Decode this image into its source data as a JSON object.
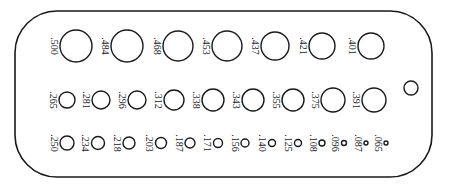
{
  "diagram": {
    "type": "drill-size-gauge",
    "unit": "inch",
    "colors": {
      "outline": "#1a1a1a",
      "background": "#ffffff"
    },
    "plate": {
      "x": 15,
      "y": 11,
      "width": 417,
      "height": 166,
      "corner_radius": 42
    },
    "hanging_hole": {
      "cx": 411,
      "cy": 88,
      "r": 7
    },
    "rows": [
      {
        "name": "row-1",
        "cy": 46,
        "holes": [
          {
            "label": ".500",
            "cx": 76,
            "r": 16
          },
          {
            "label": ".484",
            "cx": 127,
            "r": 16
          },
          {
            "label": ".468",
            "cx": 178,
            "r": 15
          },
          {
            "label": ".453",
            "cx": 227,
            "r": 15
          },
          {
            "label": ".437",
            "cx": 275,
            "r": 14
          },
          {
            "label": ".421",
            "cx": 322,
            "r": 13
          },
          {
            "label": ".401",
            "cx": 371,
            "r": 13
          }
        ]
      },
      {
        "name": "row-2",
        "cy": 100,
        "holes": [
          {
            "label": ".265",
            "cx": 67,
            "r": 8
          },
          {
            "label": ".281",
            "cx": 101,
            "r": 9
          },
          {
            "label": ".296",
            "cx": 137,
            "r": 9
          },
          {
            "label": ".312",
            "cx": 174,
            "r": 10
          },
          {
            "label": ".338",
            "cx": 213,
            "r": 11
          },
          {
            "label": ".343",
            "cx": 253,
            "r": 11
          },
          {
            "label": ".355",
            "cx": 293,
            "r": 11
          },
          {
            "label": ".375",
            "cx": 333,
            "r": 12
          },
          {
            "label": ".391",
            "cx": 374,
            "r": 12
          }
        ]
      },
      {
        "name": "row-3",
        "cy": 143,
        "holes": [
          {
            "label": ".250",
            "cx": 67,
            "r": 7
          },
          {
            "label": ".234",
            "cx": 98,
            "r": 6.5
          },
          {
            "label": ".218",
            "cx": 129,
            "r": 6
          },
          {
            "label": ".203",
            "cx": 161,
            "r": 5.5
          },
          {
            "label": ".187",
            "cx": 190,
            "r": 5
          },
          {
            "label": ".171",
            "cx": 218,
            "r": 4.5
          },
          {
            "label": ".156",
            "cx": 245,
            "r": 4
          },
          {
            "label": ".140",
            "cx": 272,
            "r": 3.5
          },
          {
            "label": ".125",
            "cx": 298,
            "r": 3.5
          },
          {
            "label": ".108",
            "cx": 322,
            "r": 3
          },
          {
            "label": ".096",
            "cx": 344,
            "r": 2.5
          },
          {
            "label": ".087",
            "cx": 366,
            "r": 2
          },
          {
            "label": ".065",
            "cx": 386,
            "r": 2
          }
        ]
      }
    ]
  }
}
